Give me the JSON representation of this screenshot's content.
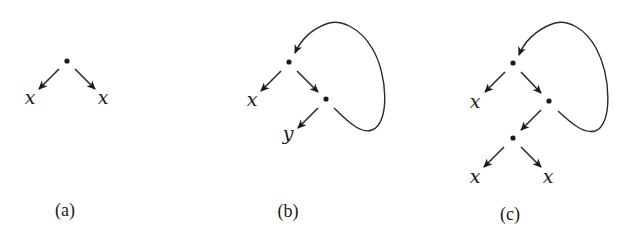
{
  "figure": {
    "panels": [
      {
        "id": "a",
        "caption": "(a)",
        "caption_pos": [
          65,
          216
        ],
        "nodes": [
          {
            "id": "r",
            "x": 67,
            "y": 61
          }
        ],
        "leaves": [
          {
            "label": "x",
            "x": 30,
            "y": 104
          },
          {
            "label": "x",
            "x": 103,
            "y": 104
          }
        ],
        "edges": [
          {
            "from": [
              59,
              69
            ],
            "to": [
              39,
              89
            ]
          },
          {
            "from": [
              75,
              69
            ],
            "to": [
              95,
              89
            ]
          }
        ],
        "loops": []
      },
      {
        "id": "b",
        "caption": "(b)",
        "caption_pos": [
          288,
          217
        ],
        "nodes": [
          {
            "id": "r",
            "x": 289,
            "y": 62
          },
          {
            "id": "n2",
            "x": 326,
            "y": 99
          }
        ],
        "leaves": [
          {
            "label": "x",
            "x": 252,
            "y": 106
          },
          {
            "label": "y",
            "x": 288,
            "y": 140
          }
        ],
        "edges": [
          {
            "from": [
              281,
              71
            ],
            "to": [
              261,
              91
            ]
          },
          {
            "from": [
              297,
              71
            ],
            "to": [
              318,
              92
            ]
          },
          {
            "from": [
              318,
              108
            ],
            "to": [
              298,
              128
            ]
          }
        ],
        "loops": [
          {
            "path": "M 334 108 C 350 124, 362 134, 372 130 C 390 124, 388 74, 372 48 C 360 28, 340 18, 326 24 C 310 30, 300 42, 295 53",
            "tip": [
              295,
              53
            ],
            "dir": [
              -0.45,
              0.9
            ]
          }
        ]
      },
      {
        "id": "c",
        "caption": "(c)",
        "caption_pos": [
          510,
          220
        ],
        "nodes": [
          {
            "id": "r",
            "x": 513,
            "y": 63
          },
          {
            "id": "n2",
            "x": 549,
            "y": 101
          },
          {
            "id": "n3",
            "x": 513,
            "y": 138
          }
        ],
        "leaves": [
          {
            "label": "x",
            "x": 475,
            "y": 108
          },
          {
            "label": "x",
            "x": 475,
            "y": 183
          },
          {
            "label": "x",
            "x": 548,
            "y": 183
          }
        ],
        "edges": [
          {
            "from": [
              505,
              72
            ],
            "to": [
              485,
              92
            ]
          },
          {
            "from": [
              521,
              72
            ],
            "to": [
              541,
              93
            ]
          },
          {
            "from": [
              541,
              110
            ],
            "to": [
              521,
              130
            ]
          },
          {
            "from": [
              504,
              147
            ],
            "to": [
              484,
              167
            ]
          },
          {
            "from": [
              521,
              147
            ],
            "to": [
              541,
              167
            ]
          }
        ],
        "loops": [
          {
            "path": "M 558 111 C 572 124, 584 134, 595 131 C 613 125, 611 76, 596 48 C 585 28, 566 18, 552 24 C 536 30, 524 42, 519 55",
            "tip": [
              519,
              55
            ],
            "dir": [
              -0.4,
              0.92
            ]
          }
        ]
      }
    ]
  }
}
